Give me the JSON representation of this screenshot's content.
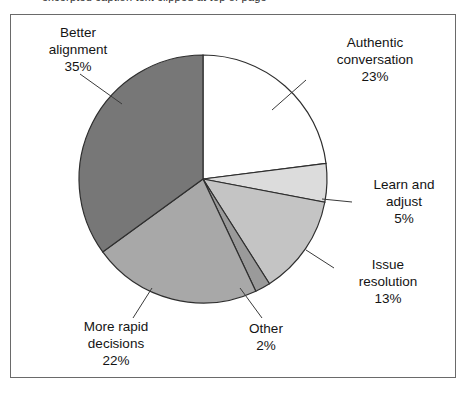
{
  "figure": {
    "partial_caption_above": "excerpted caption text clipped at top of page",
    "frame_border_color": "#6a6a6a",
    "background_color": "#ffffff"
  },
  "chart_data": {
    "type": "pie",
    "title": "",
    "xlabel": "",
    "ylabel": "",
    "legend_position": "callout-labels",
    "grid": false,
    "start_angle_deg": 90,
    "direction": "clockwise",
    "categories": [
      "Authentic conversation",
      "Learn and adjust",
      "Issue resolution",
      "Other",
      "More rapid decisions",
      "Better alignment"
    ],
    "values": [
      23,
      5,
      13,
      2,
      22,
      35
    ],
    "value_labels": [
      "23%",
      "5%",
      "13%",
      "2%",
      "22%",
      "35%"
    ],
    "colors": [
      "#ffffff",
      "#dcdcdc",
      "#c4c4c4",
      "#9a9a9a",
      "#a8a8a8",
      "#777777"
    ],
    "slice_border_color": "#2e2e2e",
    "slices": [
      {
        "name": "Authentic conversation",
        "label_line1": "Authentic",
        "label_line2": "conversation",
        "percent": "23%",
        "value": 23,
        "color": "#ffffff"
      },
      {
        "name": "Learn and adjust",
        "label_line1": "Learn and",
        "label_line2": "adjust",
        "percent": "5%",
        "value": 5,
        "color": "#dcdcdc"
      },
      {
        "name": "Issue resolution",
        "label_line1": "Issue",
        "label_line2": "resolution",
        "percent": "13%",
        "value": 13,
        "color": "#c4c4c4"
      },
      {
        "name": "Other",
        "label_line1": "Other",
        "label_line2": "",
        "percent": "2%",
        "value": 2,
        "color": "#9a9a9a"
      },
      {
        "name": "More rapid decisions",
        "label_line1": "More rapid",
        "label_line2": "decisions",
        "percent": "22%",
        "value": 22,
        "color": "#a8a8a8"
      },
      {
        "name": "Better alignment",
        "label_line1": "Better",
        "label_line2": "alignment",
        "percent": "35%",
        "value": 35,
        "color": "#777777"
      }
    ]
  }
}
